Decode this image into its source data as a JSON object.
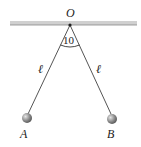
{
  "diagram": {
    "pivot_label": "O",
    "angle_label": "10",
    "left_length_label": "ℓ",
    "right_length_label": "ℓ",
    "ball_a_label": "A",
    "ball_b_label": "B",
    "colors": {
      "ceiling": "#c8c8c8",
      "string": "#555555",
      "ball": "#8a8a8a"
    }
  }
}
